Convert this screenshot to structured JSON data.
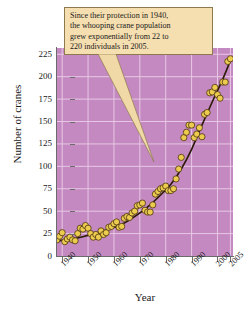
{
  "chart_data": {
    "type": "scatter",
    "title": "",
    "xlabel": "Year",
    "ylabel": "Number of cranes",
    "xlim": [
      1938,
      2006
    ],
    "ylim": [
      0,
      232
    ],
    "xticks": [
      1940,
      1950,
      1960,
      1970,
      1980,
      1990,
      2000,
      2005
    ],
    "yticks": [
      0,
      25,
      50,
      75,
      100,
      125,
      150,
      175,
      200,
      225
    ],
    "grid": true,
    "legend": "none",
    "series": [
      {
        "name": "Whooping crane population",
        "marker": "circle",
        "marker_color": "#eccb4e",
        "marker_edge_color": "#4a3410",
        "points": [
          [
            1938,
            18
          ],
          [
            1939,
            22
          ],
          [
            1940,
            26
          ],
          [
            1941,
            16
          ],
          [
            1942,
            19
          ],
          [
            1943,
            21
          ],
          [
            1944,
            18
          ],
          [
            1945,
            17
          ],
          [
            1946,
            25
          ],
          [
            1947,
            31
          ],
          [
            1948,
            30
          ],
          [
            1949,
            34
          ],
          [
            1950,
            31
          ],
          [
            1951,
            25
          ],
          [
            1952,
            21
          ],
          [
            1953,
            24
          ],
          [
            1954,
            21
          ],
          [
            1955,
            28
          ],
          [
            1956,
            24
          ],
          [
            1957,
            26
          ],
          [
            1958,
            32
          ],
          [
            1959,
            33
          ],
          [
            1960,
            36
          ],
          [
            1961,
            38
          ],
          [
            1962,
            32
          ],
          [
            1963,
            33
          ],
          [
            1964,
            42
          ],
          [
            1965,
            44
          ],
          [
            1966,
            43
          ],
          [
            1967,
            48
          ],
          [
            1968,
            50
          ],
          [
            1969,
            56
          ],
          [
            1970,
            57
          ],
          [
            1971,
            59
          ],
          [
            1972,
            51
          ],
          [
            1973,
            49
          ],
          [
            1974,
            49
          ],
          [
            1975,
            57
          ],
          [
            1976,
            69
          ],
          [
            1977,
            72
          ],
          [
            1978,
            75
          ],
          [
            1979,
            76
          ],
          [
            1980,
            78
          ],
          [
            1981,
            73
          ],
          [
            1982,
            73
          ],
          [
            1983,
            75
          ],
          [
            1984,
            86
          ],
          [
            1985,
            97
          ],
          [
            1986,
            110
          ],
          [
            1987,
            132
          ],
          [
            1988,
            138
          ],
          [
            1989,
            146
          ],
          [
            1990,
            146
          ],
          [
            1991,
            132
          ],
          [
            1992,
            136
          ],
          [
            1993,
            143
          ],
          [
            1994,
            133
          ],
          [
            1995,
            158
          ],
          [
            1996,
            160
          ],
          [
            1997,
            182
          ],
          [
            1998,
            183
          ],
          [
            1999,
            188
          ],
          [
            2000,
            180
          ],
          [
            2001,
            176
          ],
          [
            2002,
            194
          ],
          [
            2003,
            194
          ],
          [
            2004,
            217
          ],
          [
            2005,
            220
          ]
        ]
      }
    ],
    "trend_curve": {
      "name": "exponential fit",
      "color": "#2b1a08",
      "description": "smooth exponential growth curve from about 17 in 1938 to about 218 in 2005",
      "points": [
        [
          1938,
          17
        ],
        [
          1942,
          18
        ],
        [
          1946,
          20
        ],
        [
          1950,
          23
        ],
        [
          1954,
          26
        ],
        [
          1958,
          30
        ],
        [
          1962,
          34
        ],
        [
          1966,
          40
        ],
        [
          1970,
          48
        ],
        [
          1974,
          57
        ],
        [
          1978,
          68
        ],
        [
          1982,
          80
        ],
        [
          1986,
          97
        ],
        [
          1990,
          119
        ],
        [
          1994,
          146
        ],
        [
          1998,
          172
        ],
        [
          2002,
          197
        ],
        [
          2005,
          218
        ]
      ]
    },
    "annotation": {
      "lines": [
        "Since their protection in 1940,",
        "the whooping crane population",
        "grew exponentially from 22 to",
        "220 individuals in 2005."
      ],
      "background": "#f5deb0",
      "border": "#8c7a4e",
      "points_to": "data points around 1975"
    }
  },
  "colors": {
    "plot_background": "#c489c0",
    "gridline": "#e7c8e4",
    "axis": "#6b6b6b",
    "marker_fill": "#eccb4e",
    "marker_edge": "#4a3410",
    "curve": "#2b1a08",
    "callout_fill": "#f5deb0",
    "callout_border": "#8c7a4e",
    "page_background": "#ffffff"
  }
}
